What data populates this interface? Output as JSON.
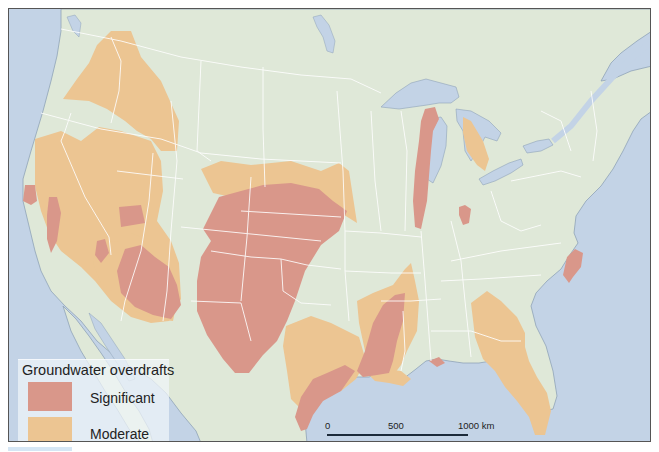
{
  "map": {
    "region": "Contiguous United States",
    "colors": {
      "land": "#dfe8d8",
      "water": "#c3d3e6",
      "significant": "#d9978a",
      "moderate": "#ecc592",
      "state_border": "#ffffff"
    }
  },
  "legend": {
    "title": "Groundwater overdrafts",
    "items": [
      {
        "label": "Significant",
        "color": "#d9978a"
      },
      {
        "label": "Moderate",
        "color": "#ecc592"
      }
    ]
  },
  "scale_bar": {
    "ticks": [
      "0",
      "500",
      "1000 km"
    ],
    "unit": "km"
  }
}
